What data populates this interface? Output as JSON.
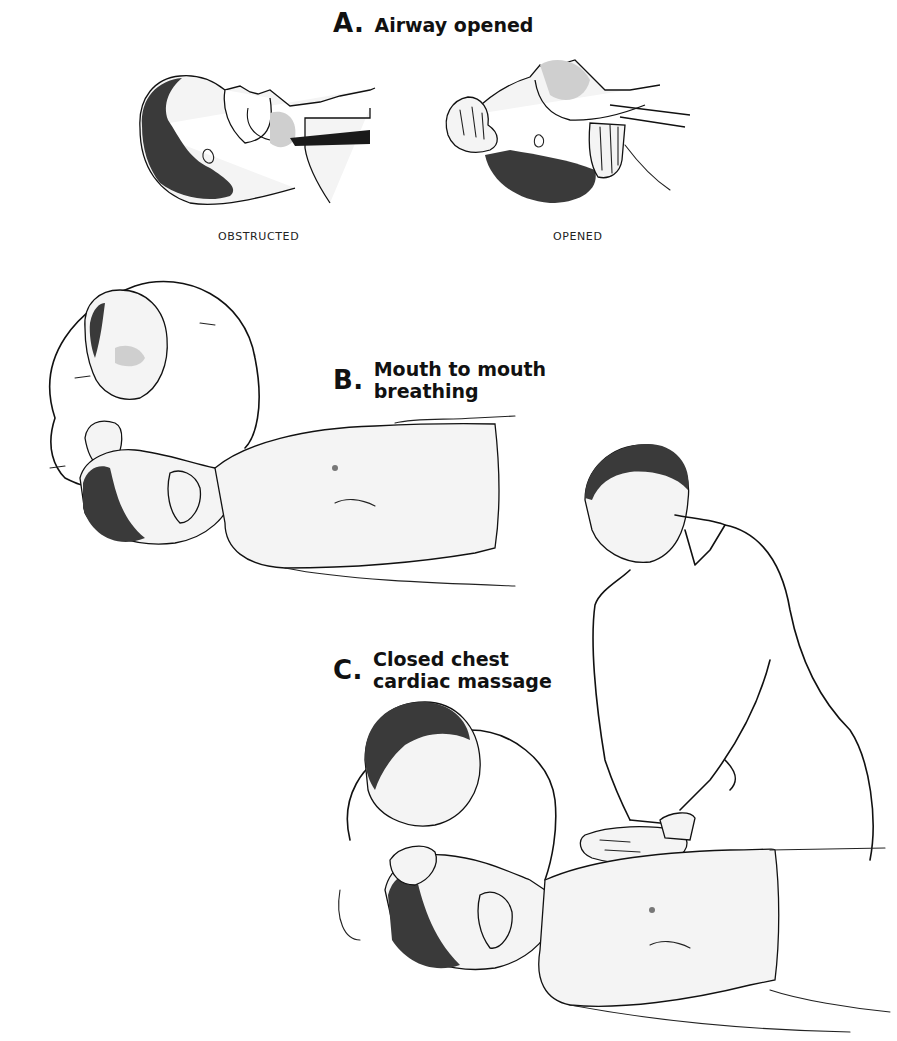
{
  "figure": {
    "sections": [
      {
        "id": "A",
        "letter": "A.",
        "title": "Airway opened",
        "panels": [
          {
            "caption": "OBSTRUCTED",
            "illustration": "head-tilted-forward-airway-blocked-by-tongue"
          },
          {
            "caption": "OPENED",
            "illustration": "head-tilted-back-airway-clear"
          }
        ]
      },
      {
        "id": "B",
        "letter": "B.",
        "title_lines": [
          "Mouth to mouth",
          "breathing"
        ],
        "illustration": "rescuer-giving-mouth-to-mouth-to-supine-patient"
      },
      {
        "id": "C",
        "letter": "C.",
        "title_lines": [
          "Closed chest",
          "cardiac massage"
        ],
        "illustration": "two-rescuers-chest-compression-and-ventilation"
      }
    ]
  },
  "colors": {
    "background": "#ffffff",
    "ink": "#111111"
  }
}
